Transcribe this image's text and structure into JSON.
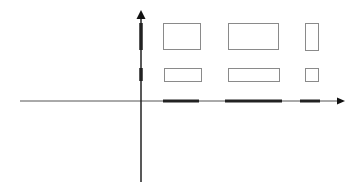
{
  "diagram": {
    "title": "",
    "width": 358,
    "height": 191,
    "colors": {
      "background": "#ffffff",
      "axis": "#555555",
      "projection": "#222222",
      "rect_stroke": "#8a8a8a"
    },
    "x_axis": {
      "x1": 20,
      "x2": 345,
      "y": 101
    },
    "y_axis": {
      "x": 141,
      "y1": 182,
      "y2": 10
    },
    "rectangles": [
      {
        "id": "rect-top-left",
        "x": 163,
        "y": 23,
        "w": 37,
        "h": 26
      },
      {
        "id": "rect-bottom-left",
        "x": 164,
        "y": 68,
        "w": 37,
        "h": 13
      },
      {
        "id": "rect-top-middle",
        "x": 228,
        "y": 23,
        "w": 50,
        "h": 26
      },
      {
        "id": "rect-bottom-middle",
        "x": 228,
        "y": 68,
        "w": 51,
        "h": 13
      },
      {
        "id": "rect-top-right",
        "x": 305,
        "y": 23,
        "w": 13,
        "h": 27
      },
      {
        "id": "rect-bottom-right",
        "x": 305,
        "y": 68,
        "w": 13,
        "h": 13
      }
    ],
    "x_projections": [
      {
        "x1": 163,
        "x2": 199
      },
      {
        "x1": 225,
        "x2": 282
      },
      {
        "x1": 300,
        "x2": 320
      }
    ],
    "y_projections": [
      {
        "y1": 23,
        "y2": 50
      },
      {
        "y1": 68,
        "y2": 81
      }
    ]
  }
}
